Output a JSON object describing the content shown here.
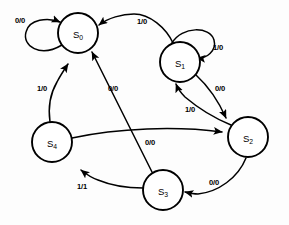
{
  "diagram": {
    "type": "finite-state-machine",
    "notation": "input/output",
    "background_color": "#fdfdfd",
    "stroke_color": "#000000",
    "node_fill_color": "#ffffff"
  },
  "states": [
    {
      "id": "S0",
      "label": "S",
      "subscript": "0",
      "cx": 78,
      "cy": 33,
      "r": 20
    },
    {
      "id": "S1",
      "label": "S",
      "subscript": "1",
      "cx": 180,
      "cy": 62,
      "r": 20
    },
    {
      "id": "S2",
      "label": "S",
      "subscript": "2",
      "cx": 248,
      "cy": 137,
      "r": 20
    },
    {
      "id": "S3",
      "label": "S",
      "subscript": "3",
      "cx": 163,
      "cy": 190,
      "r": 20
    },
    {
      "id": "S4",
      "label": "S",
      "subscript": "4",
      "cx": 52,
      "cy": 142,
      "r": 20
    }
  ],
  "transitions": [
    {
      "id": "t0",
      "from": "S0",
      "to": "S0",
      "label": "0/0",
      "kind": "self-loop",
      "lx": 20,
      "ly": 20
    },
    {
      "id": "t1",
      "from": "S1",
      "to": "S0",
      "label": "1/0",
      "kind": "curve",
      "lx": 142,
      "ly": 21
    },
    {
      "id": "t2",
      "from": "S1",
      "to": "S1",
      "label": "1/0",
      "kind": "self-loop",
      "lx": 218,
      "ly": 47
    },
    {
      "id": "t3",
      "from": "S1",
      "to": "S2",
      "label": "0/0",
      "kind": "curve",
      "lx": 220,
      "ly": 88
    },
    {
      "id": "t4",
      "from": "S2",
      "to": "S1",
      "label": "1/0",
      "kind": "curve",
      "lx": 190,
      "ly": 109
    },
    {
      "id": "t5",
      "from": "S2",
      "to": "S3",
      "label": "0/0",
      "kind": "curve",
      "lx": 214,
      "ly": 182
    },
    {
      "id": "t6",
      "from": "S3",
      "to": "S0",
      "label": "0/0",
      "kind": "curve",
      "lx": 113,
      "ly": 88
    },
    {
      "id": "t7",
      "from": "S3",
      "to": "S4",
      "label": "1/1",
      "kind": "curve",
      "lx": 82,
      "ly": 186
    },
    {
      "id": "t8",
      "from": "S4",
      "to": "S0",
      "label": "1/0",
      "kind": "curve",
      "lx": 42,
      "ly": 88
    },
    {
      "id": "t9",
      "from": "S4",
      "to": "S2",
      "label": "0/0",
      "kind": "curve",
      "lx": 150,
      "ly": 142
    }
  ]
}
